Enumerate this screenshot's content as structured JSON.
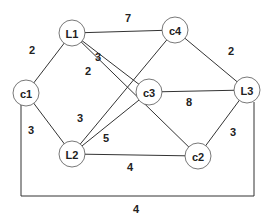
{
  "graph": {
    "nodes": [
      {
        "id": "L1",
        "label": "L1",
        "x": 72,
        "y": 33
      },
      {
        "id": "c4",
        "label": "c4",
        "x": 175,
        "y": 30
      },
      {
        "id": "c1",
        "label": "c1",
        "x": 26,
        "y": 93
      },
      {
        "id": "c3",
        "label": "c3",
        "x": 149,
        "y": 92
      },
      {
        "id": "L3",
        "label": "L3",
        "x": 247,
        "y": 90
      },
      {
        "id": "L2",
        "label": "L2",
        "x": 72,
        "y": 154
      },
      {
        "id": "c2",
        "label": "c2",
        "x": 198,
        "y": 156
      }
    ],
    "edges": [
      {
        "from": "L1",
        "to": "c4",
        "weight": "7"
      },
      {
        "from": "L1",
        "to": "c1",
        "weight": "2"
      },
      {
        "from": "L1",
        "to": "c3",
        "weight": "3"
      },
      {
        "from": "L1",
        "to": "c2",
        "weight": "2"
      },
      {
        "from": "c4",
        "to": "L3",
        "weight": "2"
      },
      {
        "from": "c4",
        "to": "L2",
        "weight": "3"
      },
      {
        "from": "c3",
        "to": "L3",
        "weight": "8"
      },
      {
        "from": "c3",
        "to": "L2",
        "weight": "5"
      },
      {
        "from": "c1",
        "to": "L2",
        "weight": "3"
      },
      {
        "from": "L2",
        "to": "c2",
        "weight": "4"
      },
      {
        "from": "L3",
        "to": "c2",
        "weight": "3"
      },
      {
        "from": "c1",
        "to": "L3",
        "weight": "4",
        "route": "bottom-loop"
      }
    ],
    "weight_labels": [
      {
        "text": "7",
        "x": 128,
        "y": 18
      },
      {
        "text": "2",
        "x": 32,
        "y": 50
      },
      {
        "text": "3",
        "x": 98,
        "y": 57
      },
      {
        "text": "2",
        "x": 88,
        "y": 71
      },
      {
        "text": "2",
        "x": 231,
        "y": 51
      },
      {
        "text": "8",
        "x": 189,
        "y": 102
      },
      {
        "text": "3",
        "x": 31,
        "y": 130
      },
      {
        "text": "3",
        "x": 80,
        "y": 118
      },
      {
        "text": "5",
        "x": 106,
        "y": 138
      },
      {
        "text": "4",
        "x": 130,
        "y": 167
      },
      {
        "text": "3",
        "x": 233,
        "y": 132
      },
      {
        "text": "4",
        "x": 136,
        "y": 209
      }
    ]
  }
}
